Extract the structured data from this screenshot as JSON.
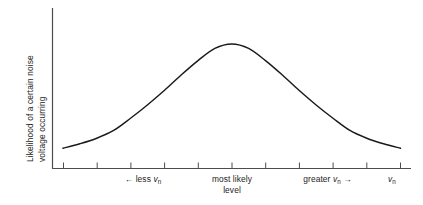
{
  "figure": {
    "name": "noise-voltage-probability-distribution",
    "background_color": "#ffffff",
    "line_color": "#1a1a1a",
    "axis_color": "#4d4d4d",
    "text_color": "#1c1c1c"
  },
  "axes": {
    "y_title_line1": "Likelihood of a certain noise",
    "y_title_line2": "voltage occurring",
    "x_axis_variable_label_main": "v",
    "x_axis_variable_label_sub": "n",
    "x_labels": [
      {
        "id": "less",
        "arrow": "←",
        "text": "less",
        "variable_main": "v",
        "variable_sub": "n",
        "full_text": "← less v_n"
      },
      {
        "id": "most-likely",
        "line1": "most likely",
        "line2": "level",
        "full_text": "most likely level"
      },
      {
        "id": "greater",
        "text": "greater",
        "variable_main": "v",
        "variable_sub": "n",
        "arrow": "→",
        "full_text": "greater v_n →"
      }
    ]
  },
  "chart_data": {
    "type": "line",
    "title": "",
    "subtitle": "",
    "xlabel": "v_n",
    "ylabel": "Likelihood of a certain noise voltage occurring",
    "grid": false,
    "legend": null,
    "axis_ticks_labelled": false,
    "xlim": [
      0,
      10
    ],
    "ylim": [
      0,
      1.1
    ],
    "x_tick_count": 11,
    "x_tick_positions": [
      0,
      1,
      2,
      3,
      4,
      5,
      6,
      7,
      8,
      9,
      10
    ],
    "series": [
      {
        "name": "noise voltage likelihood",
        "shape": "gaussian",
        "mean": 5,
        "std_dev": 2.1,
        "x": [
          0,
          0.5,
          1,
          1.5,
          2,
          2.5,
          3,
          3.5,
          4,
          4.5,
          5,
          5.5,
          6,
          6.5,
          7,
          7.5,
          8,
          8.5,
          9,
          9.5,
          10
        ],
        "y": [
          0.06,
          0.1,
          0.15,
          0.22,
          0.33,
          0.45,
          0.58,
          0.72,
          0.85,
          0.96,
          1.0,
          0.96,
          0.85,
          0.72,
          0.58,
          0.45,
          0.33,
          0.22,
          0.15,
          0.1,
          0.06
        ]
      }
    ],
    "annotations": [
      {
        "text": "← less v_n",
        "x": 2.4,
        "position": "below-axis"
      },
      {
        "text": "most likely level",
        "x": 5.0,
        "position": "below-axis"
      },
      {
        "text": "greater v_n →",
        "x": 8.1,
        "position": "below-axis"
      },
      {
        "text": "v_n",
        "x": 10.4,
        "position": "axis-name"
      }
    ]
  }
}
